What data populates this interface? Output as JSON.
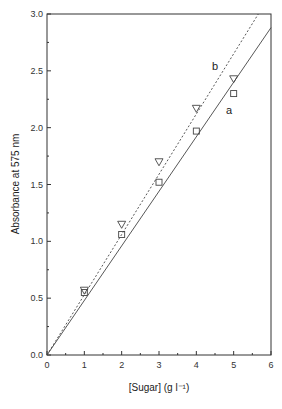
{
  "chart_data": {
    "type": "scatter",
    "title": "",
    "xlabel": "[Sugar] (g l⁻¹)",
    "ylabel": "Absorbance at 575 nm",
    "xlim": [
      0,
      6
    ],
    "ylim": [
      0.0,
      3.0
    ],
    "x_ticks": [
      "0",
      "1",
      "2",
      "3",
      "4",
      "5",
      "6"
    ],
    "y_ticks": [
      "0.0",
      "0.5",
      "1.0",
      "1.5",
      "2.0",
      "2.5",
      "3.0"
    ],
    "grid": false,
    "legend": "inline labels",
    "series": [
      {
        "name": "a",
        "marker": "square",
        "x": [
          1,
          2,
          3,
          4,
          5
        ],
        "y": [
          0.55,
          1.06,
          1.52,
          1.97,
          2.3
        ],
        "fit_line": {
          "style": "solid",
          "slope": 0.48,
          "intercept": 0.0
        }
      },
      {
        "name": "b",
        "marker": "triangle-down",
        "x": [
          1,
          2,
          3,
          4,
          5
        ],
        "y": [
          0.57,
          1.15,
          1.7,
          2.17,
          2.43
        ],
        "fit_line": {
          "style": "dotted",
          "slope": 0.53,
          "intercept": 0.0
        }
      }
    ]
  }
}
